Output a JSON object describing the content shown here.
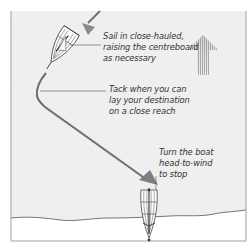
{
  "diagram": {
    "labels": {
      "sail": "Sail in close-hauled,\nraising the centreboard\nas necessary",
      "tack": "Tack when you can\nlay your destination\non a close reach",
      "stop": "Turn the boat\nhead-to-wind\nto stop"
    },
    "icons": {
      "wind": "wind-direction-arrow",
      "boat_start": "sailing-dinghy-close-hauled",
      "boat_end": "sailing-dinghy-head-to-wind",
      "course": "course-path-arrow"
    },
    "colors": {
      "water": "#ececec",
      "shore": "#ffffff",
      "course": "#6e6e6e",
      "wind_arrow": "#9a9a9a",
      "border": "#a0a0a0",
      "text": "#333333"
    }
  }
}
